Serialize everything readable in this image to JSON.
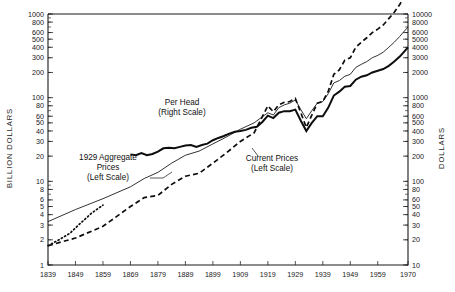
{
  "chart_data": {
    "type": "line",
    "title": "",
    "subtitle": "",
    "xlabel": "",
    "ylabel": "BILLION DOLLARS",
    "y2label": "DOLLARS",
    "xscale": "linear",
    "yscale": "log",
    "y2scale": "log",
    "xlim": [
      1839,
      1970
    ],
    "ylim": [
      1,
      1000
    ],
    "y2lim": [
      10,
      10000
    ],
    "grid": false,
    "legend_position": "inline-annotations",
    "xticks": [
      1839,
      1849,
      1859,
      1869,
      1879,
      1889,
      1899,
      1909,
      1919,
      1929,
      1939,
      1949,
      1959,
      1970
    ],
    "xticklabels": [
      "1839",
      "1849",
      "1859",
      "1869",
      "1879",
      "1889",
      "1899",
      "1909",
      "1919",
      "1929",
      "1939",
      "1949",
      "1959",
      "1970"
    ],
    "yticks": [
      1,
      2,
      3,
      4,
      5,
      6,
      8,
      10,
      20,
      30,
      40,
      50,
      60,
      80,
      100,
      200,
      300,
      400,
      500,
      600,
      800,
      1000
    ],
    "yticklabels": [
      "1",
      "2",
      "3",
      "4",
      "5",
      "6",
      "8",
      "10",
      "20",
      "30",
      "40",
      "50",
      "60",
      "80",
      "100",
      "200",
      "300",
      "400",
      "500",
      "600",
      "800",
      "1000"
    ],
    "y2ticks": [
      10,
      20,
      30,
      40,
      50,
      60,
      80,
      100,
      200,
      300,
      400,
      500,
      600,
      800,
      1000,
      2000,
      3000,
      4000,
      5000,
      6000,
      8000,
      10000
    ],
    "y2ticklabels": [
      "10",
      "20",
      "30",
      "40",
      "50",
      "60",
      "80",
      "100",
      "200",
      "300",
      "400",
      "500",
      "600",
      "800",
      "1000",
      "2000",
      "3000",
      "4000",
      "5000",
      "6000",
      "8000",
      "10000"
    ],
    "annotations": [
      {
        "id": "per-head",
        "line1": "Per Head",
        "line2": "(Right Scale)",
        "x_px": 182,
        "y_px": 105
      },
      {
        "id": "aggregate-1929",
        "line1": "1929 Aggregate",
        "line2": "Prices",
        "line3": "(Left Scale)",
        "x_px": 108,
        "y_px": 160
      },
      {
        "id": "current-prices",
        "line1": "Current Prices",
        "line2": "(Left Scale)",
        "x_px": 272,
        "y_px": 161
      }
    ],
    "series": [
      {
        "name": "Per Head (Right Scale)",
        "style": "solid-thick",
        "axis": "right",
        "x": [
          1869,
          1871,
          1873,
          1875,
          1877,
          1879,
          1881,
          1883,
          1885,
          1887,
          1889,
          1891,
          1893,
          1895,
          1897,
          1899,
          1901,
          1903,
          1905,
          1907,
          1909,
          1911,
          1913,
          1915,
          1917,
          1919,
          1921,
          1923,
          1925,
          1927,
          1929,
          1931,
          1933,
          1935,
          1937,
          1939,
          1941,
          1943,
          1945,
          1947,
          1949,
          1951,
          1953,
          1955,
          1957,
          1959,
          1961,
          1963,
          1965,
          1967,
          1970
        ],
        "values": [
          210,
          205,
          218,
          205,
          212,
          226,
          248,
          252,
          248,
          258,
          268,
          272,
          258,
          272,
          282,
          310,
          330,
          348,
          372,
          392,
          400,
          412,
          436,
          448,
          512,
          610,
          570,
          660,
          690,
          690,
          720,
          530,
          400,
          500,
          600,
          600,
          760,
          1060,
          1180,
          1350,
          1380,
          1640,
          1780,
          1850,
          2000,
          2100,
          2200,
          2400,
          2700,
          3100,
          4000
        ]
      },
      {
        "name": "1929 Aggregate Prices (Left Scale)",
        "style": "solid-thin",
        "axis": "left",
        "x": [
          1839,
          1849,
          1859,
          1869,
          1874,
          1879,
          1884,
          1889,
          1894,
          1899,
          1904,
          1909,
          1914,
          1919,
          1921,
          1923,
          1925,
          1927,
          1929,
          1931,
          1933,
          1935,
          1937,
          1939,
          1941,
          1943,
          1945,
          1947,
          1949,
          1951,
          1953,
          1955,
          1957,
          1959,
          1961,
          1963,
          1965,
          1967,
          1970
        ],
        "values": [
          3.3,
          4.6,
          6.2,
          8.6,
          10.8,
          12.8,
          16.5,
          20.5,
          23.0,
          28.0,
          34.0,
          42.0,
          50.0,
          66.0,
          62.0,
          76.0,
          82.0,
          86.0,
          94.0,
          72.0,
          56.0,
          70.0,
          86.0,
          90.0,
          112.0,
          150.0,
          160.0,
          180.0,
          190.0,
          230.0,
          250.0,
          270.0,
          300.0,
          320.0,
          350.0,
          400.0,
          460.0,
          540.0,
          700.0
        ]
      },
      {
        "name": "Current Prices (Left Scale)",
        "style": "dashed",
        "axis": "left",
        "x": [
          1839,
          1849,
          1859,
          1869,
          1874,
          1879,
          1884,
          1889,
          1894,
          1899,
          1904,
          1909,
          1914,
          1919,
          1921,
          1923,
          1925,
          1927,
          1929,
          1931,
          1933,
          1935,
          1937,
          1939,
          1941,
          1943,
          1945,
          1947,
          1949,
          1951,
          1953,
          1955,
          1957,
          1959,
          1961,
          1963,
          1965,
          1967,
          1970
        ],
        "values": [
          1.7,
          2.1,
          2.9,
          5.0,
          6.4,
          6.8,
          9.2,
          11.5,
          12.5,
          16.5,
          22.0,
          30.0,
          38.0,
          80.0,
          68.0,
          82.0,
          88.0,
          90.0,
          98.0,
          66.0,
          44.0,
          62.0,
          86.0,
          90.0,
          120.0,
          190.0,
          215.0,
          280.0,
          300.0,
          400.0,
          460.0,
          520.0,
          600.0,
          660.0,
          740.0,
          880.0,
          1050.0,
          1300.0,
          1900.0
        ]
      },
      {
        "name": "Early dotted series (Left Scale)",
        "style": "dotted",
        "axis": "left",
        "x": [
          1839,
          1843,
          1847,
          1851,
          1855,
          1859
        ],
        "values": [
          1.7,
          2.0,
          2.4,
          3.2,
          4.2,
          5.2
        ]
      }
    ]
  }
}
